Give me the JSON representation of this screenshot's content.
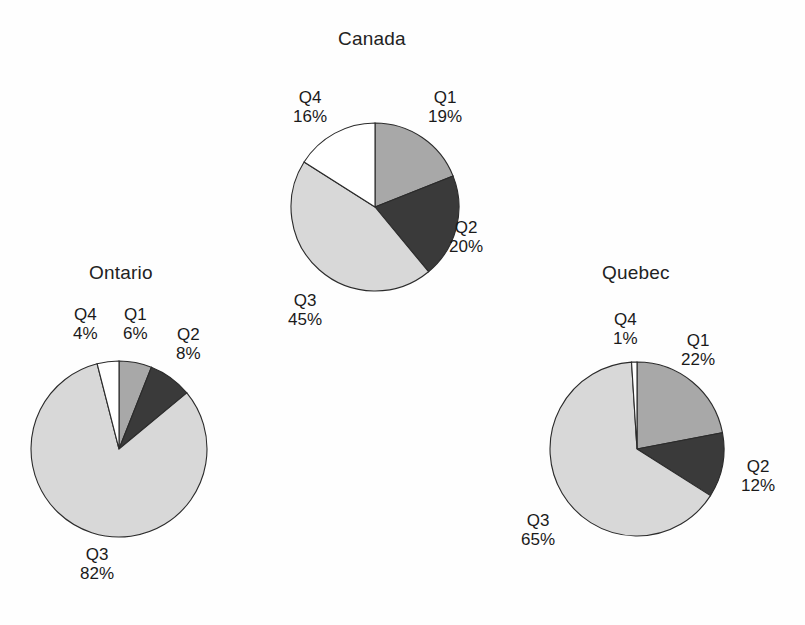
{
  "page": {
    "background_color": "#fefefe",
    "width": 805,
    "height": 625
  },
  "palette": {
    "q1_fill": "#a8a8a8",
    "q2_fill": "#3a3a3a",
    "q3_fill": "#d8d8d8",
    "q4_fill": "#ffffff",
    "outline": "#2b2b2b",
    "text": "#1a1a1a"
  },
  "charts": [
    {
      "id": "canada",
      "title": "Canada",
      "title_left": 338,
      "title_top": 28,
      "center_x": 375,
      "center_y": 207,
      "radius": 84,
      "slices": [
        {
          "name": "Q1",
          "value": 19,
          "value_text": "19%",
          "fill_key": "q1_fill",
          "label_left": 428,
          "label_top": 88
        },
        {
          "name": "Q2",
          "value": 20,
          "value_text": "20%",
          "fill_key": "q2_fill",
          "label_left": 449,
          "label_top": 218
        },
        {
          "name": "Q3",
          "value": 45,
          "value_text": "45%",
          "fill_key": "q3_fill",
          "label_left": 288,
          "label_top": 291
        },
        {
          "name": "Q4",
          "value": 16,
          "value_text": "16%",
          "fill_key": "q4_fill",
          "label_left": 293,
          "label_top": 88
        }
      ]
    },
    {
      "id": "ontario",
      "title": "Ontario",
      "title_left": 89,
      "title_top": 262,
      "center_x": 119,
      "center_y": 449,
      "radius": 88,
      "slices": [
        {
          "name": "Q1",
          "value": 6,
          "value_text": "6%",
          "fill_key": "q1_fill",
          "label_left": 123,
          "label_top": 305
        },
        {
          "name": "Q2",
          "value": 8,
          "value_text": "8%",
          "fill_key": "q2_fill",
          "label_left": 176,
          "label_top": 325
        },
        {
          "name": "Q3",
          "value": 82,
          "value_text": "82%",
          "fill_key": "q3_fill",
          "label_left": 80,
          "label_top": 545
        },
        {
          "name": "Q4",
          "value": 4,
          "value_text": "4%",
          "fill_key": "q4_fill",
          "label_left": 73,
          "label_top": 305
        }
      ]
    },
    {
      "id": "quebec",
      "title": "Quebec",
      "title_left": 602,
      "title_top": 262,
      "center_x": 637,
      "center_y": 449,
      "radius": 87,
      "slices": [
        {
          "name": "Q1",
          "value": 22,
          "value_text": "22%",
          "fill_key": "q1_fill",
          "label_left": 681,
          "label_top": 331
        },
        {
          "name": "Q2",
          "value": 12,
          "value_text": "12%",
          "fill_key": "q2_fill",
          "label_left": 741,
          "label_top": 457
        },
        {
          "name": "Q3",
          "value": 65,
          "value_text": "65%",
          "fill_key": "q3_fill",
          "label_left": 521,
          "label_top": 511
        },
        {
          "name": "Q4",
          "value": 1,
          "value_text": "1%",
          "fill_key": "q4_fill",
          "label_left": 613,
          "label_top": 310
        }
      ]
    }
  ],
  "chart_data": [
    {
      "type": "pie",
      "title": "Canada",
      "categories": [
        "Q1",
        "Q2",
        "Q3",
        "Q4"
      ],
      "values": [
        19,
        20,
        45,
        16
      ],
      "value_labels": [
        "19%",
        "20%",
        "45%",
        "16%"
      ],
      "units": "percent",
      "start_angle_deg": 0,
      "direction": "clockwise",
      "legend": "none",
      "slice_colors": [
        "#a8a8a8",
        "#3a3a3a",
        "#d8d8d8",
        "#ffffff"
      ]
    },
    {
      "type": "pie",
      "title": "Ontario",
      "categories": [
        "Q1",
        "Q2",
        "Q3",
        "Q4"
      ],
      "values": [
        6,
        8,
        82,
        4
      ],
      "value_labels": [
        "6%",
        "8%",
        "82%",
        "4%"
      ],
      "units": "percent",
      "start_angle_deg": 0,
      "direction": "clockwise",
      "legend": "none",
      "slice_colors": [
        "#a8a8a8",
        "#3a3a3a",
        "#d8d8d8",
        "#ffffff"
      ]
    },
    {
      "type": "pie",
      "title": "Quebec",
      "categories": [
        "Q1",
        "Q2",
        "Q3",
        "Q4"
      ],
      "values": [
        22,
        12,
        65,
        1
      ],
      "value_labels": [
        "22%",
        "12%",
        "65%",
        "1%"
      ],
      "units": "percent",
      "start_angle_deg": 0,
      "direction": "clockwise",
      "legend": "none",
      "slice_colors": [
        "#a8a8a8",
        "#3a3a3a",
        "#d8d8d8",
        "#ffffff"
      ]
    }
  ]
}
